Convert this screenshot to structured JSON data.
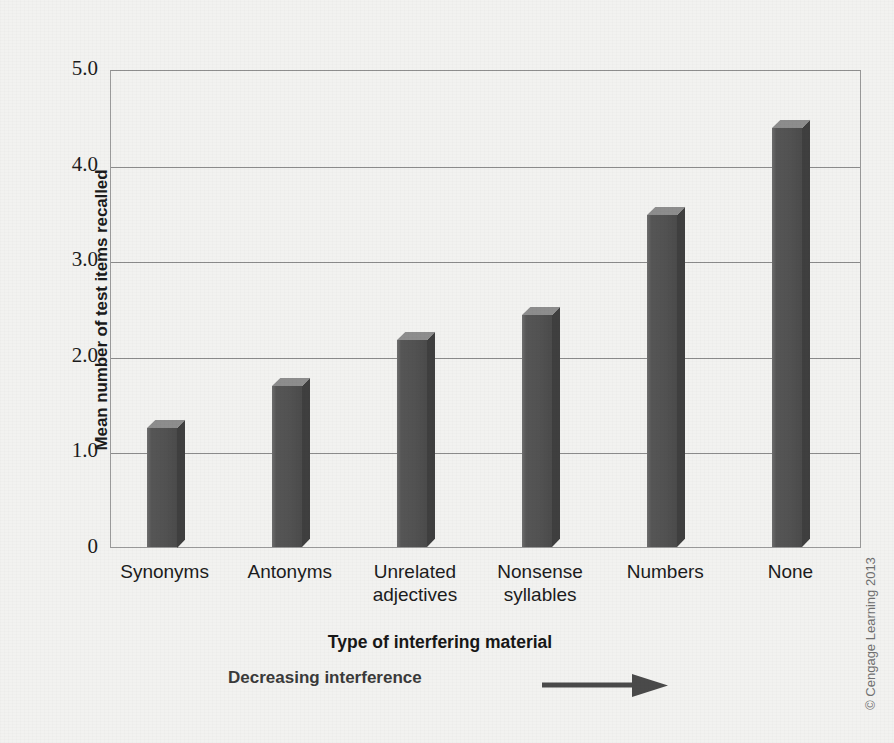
{
  "chart_data": {
    "type": "bar",
    "title": "",
    "categories": [
      "Synonyms",
      "Antonyms",
      "Unrelated adjectives",
      "Nonsense syllables",
      "Numbers",
      "None"
    ],
    "category_lines": [
      [
        "Synonyms"
      ],
      [
        "Antonyms"
      ],
      [
        "Unrelated",
        "adjectives"
      ],
      [
        "Nonsense",
        "syllables"
      ],
      [
        "Numbers"
      ],
      [
        "None"
      ]
    ],
    "values": [
      1.25,
      1.68,
      2.17,
      2.43,
      3.47,
      4.38
    ],
    "xlabel": "Type of interfering material",
    "ylabel": "Mean number of test items recalled",
    "ylim": [
      0,
      5.0
    ],
    "yticks": [
      "0",
      "1.0",
      "2.0",
      "3.0",
      "4.0",
      "5.0"
    ],
    "ytick_values": [
      0,
      1.0,
      2.0,
      3.0,
      4.0,
      5.0
    ],
    "grid": true,
    "legend": "none",
    "bar_color": "#525252",
    "annotation": "Decreasing interference",
    "annotation_icon": "right-arrow-icon"
  },
  "axes": {
    "y_title": "Mean number of test items recalled",
    "x_title": "Type of interfering material"
  },
  "annotation": {
    "text": "Decreasing interference"
  },
  "credit": {
    "text": "© Cengage Learning 2013"
  },
  "colors": {
    "background": "#f2f2f0",
    "bar_front": "#525252",
    "bar_top": "#8d8d8d",
    "bar_side": "#3f3f3f",
    "gridline": "#8b8b8b",
    "frame": "#9a9a9a",
    "text": "#1c1c1c"
  }
}
